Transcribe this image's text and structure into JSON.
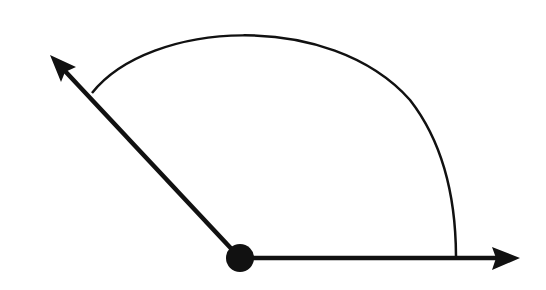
{
  "diagram": {
    "type": "angle",
    "colors": {
      "stroke": "#111111",
      "background": "#ffffff"
    },
    "vertex": {
      "x": 240,
      "y": 258
    },
    "rays": [
      {
        "name": "horizontal-ray",
        "from": [
          240,
          258
        ],
        "to": [
          520,
          258
        ]
      },
      {
        "name": "slanted-ray",
        "from": [
          240,
          258
        ],
        "to": [
          50,
          55
        ]
      }
    ],
    "arc": {
      "start": [
        92,
        93
      ],
      "end": [
        456,
        258
      ]
    }
  }
}
